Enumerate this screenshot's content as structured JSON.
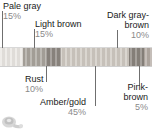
{
  "figure": {
    "watermark_icon": "camera-watermark-icon"
  },
  "chart_data": {
    "type": "bar",
    "orientation": "horizontal-stacked",
    "title": "",
    "xlabel": "",
    "ylabel": "",
    "categories": [
      "Pale gray",
      "Light brown",
      "Rust",
      "Amber/gold",
      "Dark gray-brown",
      "Pink-brown"
    ],
    "values": [
      15,
      15,
      10,
      45,
      10,
      5
    ],
    "units": "%",
    "total": 100,
    "grid": false,
    "legend": "callout-labels",
    "colors": [
      "#e9e6e2",
      "#a9a49d",
      "#8d8781",
      "#cfc9c1",
      "#8a847d",
      "#b3aaa3"
    ],
    "segments": [
      {
        "label": "Pale gray",
        "percent_label": "15%",
        "value": 15,
        "color": "#e9e6e2",
        "callout_position": "top-left"
      },
      {
        "label": "Light brown",
        "percent_label": "15%",
        "value": 15,
        "color": "#a9a49d",
        "callout_position": "top-left"
      },
      {
        "label": "Rust",
        "percent_label": "10%",
        "value": 10,
        "color": "#8d8781",
        "callout_position": "bottom-left"
      },
      {
        "label": "Amber/gold",
        "percent_label": "45%",
        "value": 45,
        "color": "#cfc9c1",
        "callout_position": "bottom-center"
      },
      {
        "label": "Dark gray-brown",
        "percent_label": "10%",
        "value": 10,
        "color": "#8a847d",
        "callout_position": "top-right"
      },
      {
        "label": "Pink-brown",
        "percent_label": "5%",
        "value": 5,
        "color": "#b3aaa3",
        "callout_position": "bottom-right"
      }
    ]
  },
  "callouts": {
    "pale_gray": {
      "name": "Pale gray",
      "percent": "15%"
    },
    "light_brown": {
      "name": "Light brown",
      "percent": "15%"
    },
    "dark_gray_brown": {
      "name_line1": "Dark gray-",
      "name_line2": "brown",
      "percent": "10%"
    },
    "rust": {
      "name": "Rust",
      "percent": "10%"
    },
    "amber_gold": {
      "name": "Amber/gold",
      "percent": "45%"
    },
    "pink_brown": {
      "name_line1": "Pink-",
      "name_line2": "brown",
      "percent": "5%"
    }
  },
  "colors": {
    "label_text": "#1a1a1a",
    "percent_text": "#8a8a8a",
    "leader_line": "#6f6f6f",
    "background": "#ffffff"
  }
}
